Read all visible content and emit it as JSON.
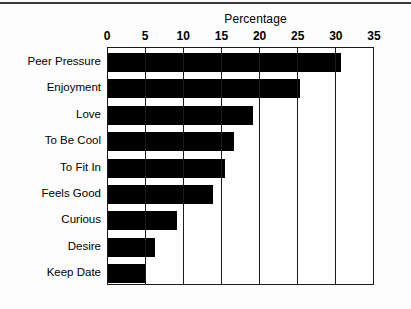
{
  "chart_data": {
    "type": "bar",
    "orientation": "horizontal",
    "title": "Percentage",
    "xlabel": "",
    "ylabel": "",
    "xlim": [
      0,
      35
    ],
    "xticks": [
      0,
      5,
      10,
      15,
      20,
      25,
      30,
      35
    ],
    "xtick_labels": [
      "0",
      "5",
      "10",
      "15",
      "20",
      "25",
      "30",
      "35"
    ],
    "grid": true,
    "grid_axis": "x",
    "legend": false,
    "categories": [
      "Peer Pressure",
      "Enjoyment",
      "Love",
      "To Be Cool",
      "To Fit In",
      "Feels Good",
      "Curious",
      "Desire",
      "Keep Date"
    ],
    "values": [
      30.5,
      25.2,
      19.0,
      16.5,
      15.4,
      13.8,
      9.1,
      6.2,
      5.0
    ],
    "bar_color": "#000000",
    "frame_color": "#1a1a1a",
    "background": "#ffffff"
  }
}
